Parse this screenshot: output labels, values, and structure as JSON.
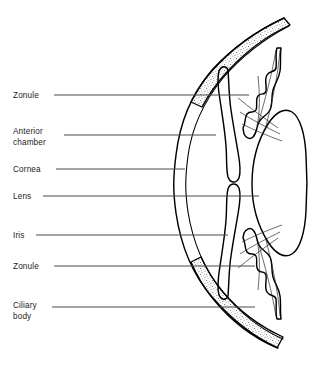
{
  "figure": {
    "background_color": "#ffffff",
    "line_color": "#000000",
    "leader_color": "#4a4a4a",
    "text_color": "#1c1c1c"
  },
  "labels": [
    {
      "id": "zonule-upper",
      "lines": [
        "Zonule"
      ],
      "text_x": 13,
      "text_y": 98,
      "leader_y": 95,
      "leader_x1": 54,
      "leader_x2": 249,
      "structure": "zonule"
    },
    {
      "id": "anterior-chamber",
      "lines": [
        "Anterior",
        "chamber"
      ],
      "text_x": 13,
      "text_y": 134,
      "leader_y": 135,
      "leader_x1": 64,
      "leader_x2": 216,
      "structure": "anterior-chamber"
    },
    {
      "id": "cornea",
      "lines": [
        "Cornea"
      ],
      "text_x": 13,
      "text_y": 172,
      "leader_y": 169,
      "leader_x1": 56,
      "leader_x2": 185,
      "structure": "cornea"
    },
    {
      "id": "lens",
      "lines": [
        "Lens"
      ],
      "text_x": 13,
      "text_y": 199,
      "leader_y": 196,
      "leader_x1": 43,
      "leader_x2": 259,
      "structure": "lens"
    },
    {
      "id": "iris",
      "lines": [
        "Iris"
      ],
      "text_x": 13,
      "text_y": 238,
      "leader_y": 235,
      "leader_x1": 36,
      "leader_x2": 228,
      "structure": "iris"
    },
    {
      "id": "zonule-lower",
      "lines": [
        "Zonule"
      ],
      "text_x": 13,
      "text_y": 269,
      "leader_y": 266,
      "leader_x1": 54,
      "leader_x2": 255,
      "structure": "zonule"
    },
    {
      "id": "ciliary-body",
      "lines": [
        "Ciliary",
        "body"
      ],
      "text_x": 13,
      "text_y": 308,
      "leader_y": 307,
      "leader_x1": 52,
      "leader_x2": 255,
      "structure": "ciliary-body"
    }
  ],
  "structures": {
    "sclera": {
      "name": "sclera",
      "texture": "stipple"
    },
    "cornea": {
      "name": "cornea"
    },
    "lens": {
      "name": "lens"
    },
    "iris": {
      "name": "iris"
    },
    "ciliary_body": {
      "name": "ciliary-body"
    },
    "zonule_fibers": {
      "name": "zonule-fibers"
    }
  }
}
